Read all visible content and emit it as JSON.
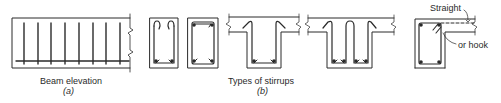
{
  "figure": {
    "panel_a": {
      "caption": "Beam elevation",
      "sub_label": "(a)",
      "stirrup_count": 8
    },
    "panel_b": {
      "caption": "Types of stirrups",
      "sub_label": "(b)",
      "stirrup_types": [
        "open U stirrup with top hooks",
        "closed stirrup",
        "single U stirrup in T-beam",
        "double U stirrup in T-beam",
        "closed stirrup in L-beam"
      ],
      "annotations": {
        "straight": "Straight",
        "or_hook": "or hook"
      }
    }
  },
  "colors": {
    "ink": "#2a2a2a",
    "background": "#ffffff"
  }
}
